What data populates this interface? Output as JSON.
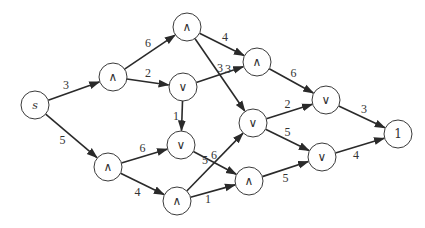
{
  "diagram": {
    "type": "directed-weighted-graph",
    "nodes": [
      {
        "id": "s",
        "label": "s"
      },
      {
        "id": "a1",
        "label": "∧"
      },
      {
        "id": "a2",
        "label": "∧"
      },
      {
        "id": "o1",
        "label": "∨"
      },
      {
        "id": "a3",
        "label": "∧"
      },
      {
        "id": "o2",
        "label": "∨"
      },
      {
        "id": "o3",
        "label": "∨"
      },
      {
        "id": "t",
        "label": "1"
      },
      {
        "id": "a4",
        "label": "∧"
      },
      {
        "id": "o4",
        "label": "∨"
      },
      {
        "id": "a5",
        "label": "∧"
      },
      {
        "id": "a6",
        "label": "∧"
      },
      {
        "id": "o5",
        "label": "∨"
      }
    ],
    "edges": [
      {
        "from": "s",
        "to": "a1",
        "weight": "3"
      },
      {
        "from": "s",
        "to": "a4",
        "weight": "5"
      },
      {
        "from": "a1",
        "to": "a2",
        "weight": "6"
      },
      {
        "from": "a1",
        "to": "o1",
        "weight": "2"
      },
      {
        "from": "a2",
        "to": "a3",
        "weight": "4"
      },
      {
        "from": "a2",
        "to": "o2",
        "weight": "3"
      },
      {
        "from": "o1",
        "to": "a3",
        "weight": "3"
      },
      {
        "from": "o1",
        "to": "o4",
        "weight": "1"
      },
      {
        "from": "a3",
        "to": "o3",
        "weight": "6"
      },
      {
        "from": "o2",
        "to": "o3",
        "weight": "2"
      },
      {
        "from": "o2",
        "to": "o5",
        "weight": "5"
      },
      {
        "from": "o3",
        "to": "t",
        "weight": "3"
      },
      {
        "from": "a4",
        "to": "o4",
        "weight": "6"
      },
      {
        "from": "a4",
        "to": "a5",
        "weight": "4"
      },
      {
        "from": "o4",
        "to": "a6",
        "weight": "6"
      },
      {
        "from": "a5",
        "to": "o2",
        "weight": "5"
      },
      {
        "from": "a5",
        "to": "a6",
        "weight": "1"
      },
      {
        "from": "a6",
        "to": "o5",
        "weight": "5"
      },
      {
        "from": "o5",
        "to": "t",
        "weight": "4"
      }
    ]
  }
}
